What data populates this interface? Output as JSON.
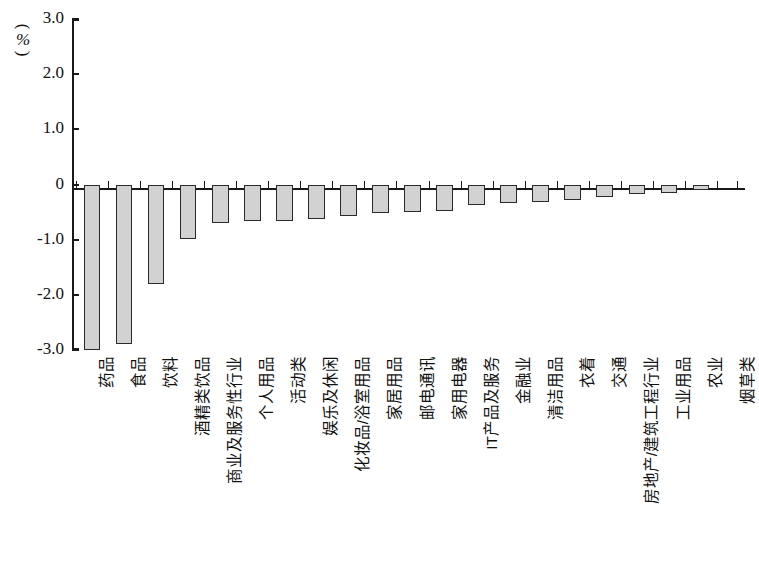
{
  "chart_data": {
    "type": "bar",
    "title": "",
    "subtitle": "",
    "xlabel": "",
    "ylabel": "",
    "unit_label": "%",
    "unit_open_paren": "(",
    "unit_close_paren": ")",
    "ylim": [
      -3.0,
      3.0
    ],
    "ytick_labels": [
      "3.0",
      "2.0",
      "1.0",
      "0",
      "-1.0",
      "-2.0",
      "-3.0"
    ],
    "ytick_values": [
      3.0,
      2.0,
      1.0,
      0,
      -1.0,
      -2.0,
      -3.0
    ],
    "grid": false,
    "legend": null,
    "legend_position": "none",
    "bar_fill_color": "#d2d2d2",
    "bar_edge_color": "#2a2a2a",
    "axis_color": "#1a1a1a",
    "categories": [
      "药品",
      "食品",
      "饮料",
      "酒精类饮品",
      "商业及服务性行业",
      "个人用品",
      "活动类",
      "娱乐及休闲",
      "化妆品/浴室用品",
      "家居用品",
      "邮电通讯",
      "家用电器",
      "IT产品及服务",
      "金融业",
      "清洁用品",
      "衣着",
      "交通",
      "房地产/建筑工程行业",
      "工业用品",
      "农业",
      "烟草类"
    ],
    "values": [
      -3.05,
      -2.9,
      -1.8,
      -0.98,
      -0.7,
      -0.66,
      -0.66,
      -0.62,
      -0.58,
      -0.52,
      -0.5,
      -0.48,
      -0.38,
      -0.33,
      -0.31,
      -0.28,
      -0.22,
      -0.18,
      -0.15,
      -0.1,
      0.0
    ]
  }
}
